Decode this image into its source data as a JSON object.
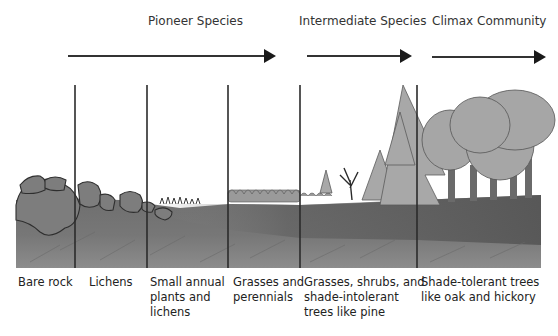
{
  "stages": [
    {
      "title": "Pioneer Species"
    },
    {
      "title": "Intermediate Species"
    },
    {
      "title": "Climax Community"
    }
  ],
  "columns": [
    {
      "lines": [
        "Bare rock"
      ]
    },
    {
      "lines": [
        "Lichens"
      ]
    },
    {
      "lines": [
        "Small annual",
        "plants and",
        "lichens"
      ]
    },
    {
      "lines": [
        "Grasses and",
        "perennials"
      ]
    },
    {
      "lines": [
        "Grasses, shrubs, and",
        "shade-intolerant",
        "trees like pine"
      ]
    },
    {
      "lines": [
        "Shade-tolerant trees",
        "like oak and hickory"
      ]
    }
  ],
  "colors": {
    "ground_light": "#8a8a8a",
    "ground_dark": "#666666",
    "rock": "#808080",
    "tree_light": "#a9a9a9",
    "line": "#2b2b2b"
  }
}
